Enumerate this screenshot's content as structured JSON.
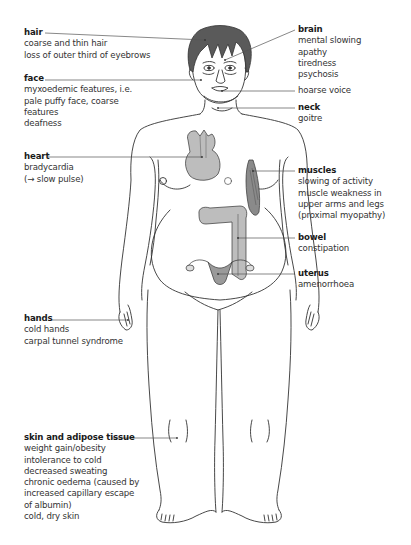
{
  "diagram": {
    "colors": {
      "outline": "#333333",
      "hair": "#555555",
      "organ_fill": "#bdbdbd",
      "organ_dark": "#8a8a8a",
      "leader_line": "#555555",
      "text": "#2a2a2a"
    },
    "labels": {
      "hair": {
        "title": "hair",
        "lines": [
          "coarse and thin hair",
          "loss of outer third of eyebrows"
        ]
      },
      "face": {
        "title": "face",
        "lines": [
          "myxoedemic features, i.e.",
          "pale puffy face, coarse",
          "features",
          "deafness"
        ]
      },
      "heart": {
        "title": "heart",
        "lines": [
          "bradycardia",
          "(→ slow pulse)"
        ]
      },
      "hands": {
        "title": "hands",
        "lines": [
          "cold hands",
          "carpal tunnel syndrome"
        ]
      },
      "skin": {
        "title": "skin and adipose tissue",
        "lines": [
          "weight gain/obesity",
          "intolerance to cold",
          "decreased sweating",
          "chronic oedema (caused by",
          "increased capillary escape",
          "of albumin)",
          "cold, dry skin"
        ]
      },
      "brain": {
        "title": "brain",
        "lines": [
          "mental slowing",
          "apathy",
          "tiredness",
          "psychosis"
        ]
      },
      "voice": {
        "title": "",
        "lines": [
          "hoarse voice"
        ]
      },
      "neck": {
        "title": "neck",
        "lines": [
          "goitre"
        ]
      },
      "muscles": {
        "title": "muscles",
        "lines": [
          "slowing of activity",
          "muscle weakness in",
          "upper arms and legs",
          "(proximal myopathy)"
        ]
      },
      "bowel": {
        "title": "bowel",
        "lines": [
          "constipation"
        ]
      },
      "uterus": {
        "title": "uterus",
        "lines": [
          "amenorrhoea"
        ]
      }
    },
    "breast_marks": {
      "left": "L",
      "right": "R"
    }
  }
}
